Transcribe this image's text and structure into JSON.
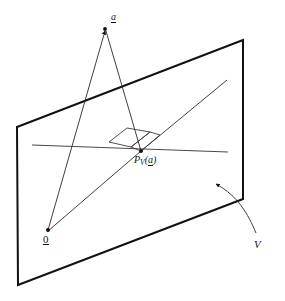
{
  "figure": {
    "kind": "geometry-diagram",
    "background_color": "#ffffff",
    "ink_color": "#111111",
    "thin_line_color": "#3a3a3a",
    "plane": {
      "name": "V",
      "label": "V",
      "edge_color": "#111111",
      "edge_width_px": 2,
      "corners": [
        {
          "x": 17,
          "y": 127
        },
        {
          "x": 243,
          "y": 40
        },
        {
          "x": 243,
          "y": 199
        },
        {
          "x": 18,
          "y": 285
        }
      ]
    },
    "points": [
      {
        "id": "a",
        "label": "a",
        "underlined": true,
        "x": 105,
        "y": 29,
        "has_dot": true,
        "has_arrowhead": true
      },
      {
        "id": "zero",
        "label": "0",
        "underlined": true,
        "x": 48,
        "y": 230,
        "has_dot": true,
        "has_arrowhead": false
      },
      {
        "id": "proj",
        "label": "P",
        "sub_label": "V",
        "arg_label": "(a)",
        "underlined_arg": true,
        "x": 141,
        "y": 151,
        "has_dot": true,
        "has_arrowhead": false
      }
    ],
    "labels": {
      "vector_a": "a",
      "origin": "0",
      "projection_P": "P",
      "projection_subscript": "V",
      "projection_argument_open": "(",
      "projection_argument": "a",
      "projection_argument_close": ")",
      "plane_name": "V"
    },
    "segments": [
      {
        "id": "zero-to-a",
        "from": {
          "x": 48,
          "y": 230
        },
        "to": {
          "x": 105,
          "y": 31
        },
        "width": 0.9
      },
      {
        "id": "a-to-proj",
        "from": {
          "x": 106,
          "y": 31
        },
        "to": {
          "x": 141,
          "y": 151
        },
        "width": 0.9
      },
      {
        "id": "proj-ray-lower",
        "from": {
          "x": 48,
          "y": 231
        },
        "to": {
          "x": 141,
          "y": 151
        },
        "width": 0.9
      },
      {
        "id": "proj-ray-upper",
        "from": {
          "x": 141,
          "y": 151
        },
        "to": {
          "x": 227,
          "y": 80
        },
        "width": 0.9
      },
      {
        "id": "plane-line",
        "from": {
          "x": 32,
          "y": 145
        },
        "to": {
          "x": 228,
          "y": 152
        },
        "width": 1.1
      }
    ],
    "right_angle_marker": {
      "id": "perpendicular-mark",
      "points": [
        {
          "x": 109,
          "y": 142
        },
        {
          "x": 127,
          "y": 128
        },
        {
          "x": 150,
          "y": 132
        },
        {
          "x": 131,
          "y": 147
        }
      ],
      "inner_points": [
        {
          "x": 131,
          "y": 147
        },
        {
          "x": 150,
          "y": 132
        },
        {
          "x": 160,
          "y": 135
        },
        {
          "x": 141,
          "y": 151
        }
      ]
    },
    "pointer_arrow": {
      "id": "plane-callout",
      "path": "M 256 233 C 248 214 238 196 216 184",
      "tip": {
        "x": 213,
        "y": 182
      },
      "width": 0.9
    }
  }
}
